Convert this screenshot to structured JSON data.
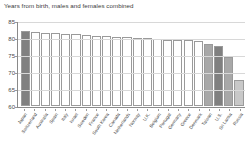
{
  "chart_title": "Years from birth, males and females combined",
  "colors": {
    "bar_default": "#ffffff",
    "bar_highlight_dark": "#808080",
    "bar_highlight_mid": "#a8a8a8",
    "bar_highlight_light": "#c8c8c8",
    "bar_outline": "#9a9a9a",
    "axis": "#8a8a8a",
    "grid": "#d8d8d8",
    "text": "#4a4a4a"
  },
  "chart_data": {
    "type": "bar",
    "title": "Years from birth, males and females combined",
    "xlabel": "",
    "ylabel": "",
    "ylim": [
      60,
      85
    ],
    "yticks": [
      60,
      65,
      70,
      75,
      80,
      85
    ],
    "grid": true,
    "legend": false,
    "categories": [
      "Japan",
      "Switzerland",
      "Australia",
      "Spain",
      "Italy",
      "Israel",
      "Sweden",
      "France",
      "South Korea",
      "Canada",
      "Netherlands",
      "Norway",
      "U.K.",
      "Belgium",
      "Portugal",
      "Germany",
      "Greece",
      "Denmark",
      "Taiwan",
      "U.S.",
      "Sri Lanka",
      "Russia"
    ],
    "values": [
      83.0,
      82.7,
      82.5,
      82.4,
      82.3,
      82.1,
      81.8,
      81.7,
      81.5,
      81.4,
      81.2,
      81.1,
      81.0,
      80.7,
      80.5,
      80.4,
      80.3,
      80.1,
      79.0,
      78.6,
      75.0,
      68.0
    ],
    "bar_styles": [
      "highlight_dark",
      "default",
      "default",
      "default",
      "default",
      "default",
      "default",
      "default",
      "default",
      "default",
      "default",
      "default",
      "default",
      "default",
      "default",
      "default",
      "default",
      "default",
      "highlight_mid",
      "highlight_dark",
      "highlight_mid",
      "highlight_light"
    ]
  }
}
